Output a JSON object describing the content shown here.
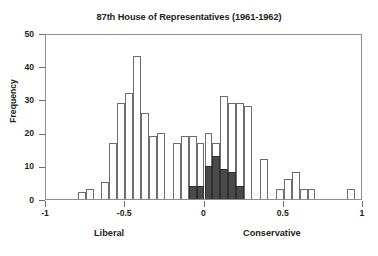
{
  "chart_data": {
    "type": "bar",
    "title": "87th House of Representatives (1961-1962)",
    "xlabel": "",
    "ylabel": "Frequency",
    "xlim": [
      -1,
      1
    ],
    "ylim": [
      0,
      50
    ],
    "grid": false,
    "legend": null,
    "x_ticks": [
      {
        "value": -1,
        "label": "-1"
      },
      {
        "value": -0.5,
        "label": "-0.5"
      },
      {
        "value": 0,
        "label": "0"
      },
      {
        "value": 0.5,
        "label": "0.5"
      },
      {
        "value": 1,
        "label": "1"
      }
    ],
    "y_ticks": [
      {
        "value": 0,
        "label": "0"
      },
      {
        "value": 10,
        "label": "10"
      },
      {
        "value": 20,
        "label": "20"
      },
      {
        "value": 30,
        "label": "30"
      },
      {
        "value": 40,
        "label": "40"
      },
      {
        "value": 50,
        "label": "50"
      }
    ],
    "annotations": [
      {
        "text": "Liberal",
        "position": "below-axis-left"
      },
      {
        "text": "Conservative",
        "position": "below-axis-right"
      }
    ],
    "bin_width": 0.05,
    "colors": {
      "light_fill": "#ffffff",
      "light_edge": "#6e6e6e",
      "dark_fill": "#4a4a4a",
      "dark_edge": "#2f2f2f",
      "axis": "#8d8d8d",
      "text": "#231f20"
    },
    "bins": [
      {
        "x0": -0.8,
        "x1": -0.75,
        "total": 2,
        "shaded": 0
      },
      {
        "x0": -0.75,
        "x1": -0.7,
        "total": 3,
        "shaded": 0
      },
      {
        "x0": -0.7,
        "x1": -0.65,
        "total": 0,
        "shaded": 0
      },
      {
        "x0": -0.65,
        "x1": -0.6,
        "total": 5,
        "shaded": 0
      },
      {
        "x0": -0.6,
        "x1": -0.55,
        "total": 17,
        "shaded": 0
      },
      {
        "x0": -0.55,
        "x1": -0.5,
        "total": 29,
        "shaded": 0
      },
      {
        "x0": -0.5,
        "x1": -0.45,
        "total": 32,
        "shaded": 0
      },
      {
        "x0": -0.45,
        "x1": -0.4,
        "total": 43,
        "shaded": 0
      },
      {
        "x0": -0.4,
        "x1": -0.35,
        "total": 26,
        "shaded": 0
      },
      {
        "x0": -0.35,
        "x1": -0.3,
        "total": 19,
        "shaded": 0
      },
      {
        "x0": -0.3,
        "x1": -0.25,
        "total": 20,
        "shaded": 0
      },
      {
        "x0": -0.25,
        "x1": -0.2,
        "total": 0,
        "shaded": 0
      },
      {
        "x0": -0.2,
        "x1": -0.15,
        "total": 17,
        "shaded": 0
      },
      {
        "x0": -0.15,
        "x1": -0.1,
        "total": 19,
        "shaded": 0
      },
      {
        "x0": -0.1,
        "x1": -0.05,
        "total": 19,
        "shaded": 4
      },
      {
        "x0": -0.05,
        "x1": 0.0,
        "total": 17,
        "shaded": 4
      },
      {
        "x0": 0.0,
        "x1": 0.05,
        "total": 20,
        "shaded": 10
      },
      {
        "x0": 0.05,
        "x1": 0.1,
        "total": 17,
        "shaded": 13
      },
      {
        "x0": 0.1,
        "x1": 0.15,
        "total": 31,
        "shaded": 9
      },
      {
        "x0": 0.15,
        "x1": 0.2,
        "total": 29,
        "shaded": 8
      },
      {
        "x0": 0.2,
        "x1": 0.25,
        "total": 29,
        "shaded": 4
      },
      {
        "x0": 0.25,
        "x1": 0.3,
        "total": 28,
        "shaded": 0
      },
      {
        "x0": 0.3,
        "x1": 0.35,
        "total": 0,
        "shaded": 0
      },
      {
        "x0": 0.35,
        "x1": 0.4,
        "total": 12,
        "shaded": 0
      },
      {
        "x0": 0.4,
        "x1": 0.45,
        "total": 0,
        "shaded": 0
      },
      {
        "x0": 0.45,
        "x1": 0.5,
        "total": 3,
        "shaded": 0
      },
      {
        "x0": 0.5,
        "x1": 0.55,
        "total": 6,
        "shaded": 0
      },
      {
        "x0": 0.55,
        "x1": 0.6,
        "total": 8,
        "shaded": 0
      },
      {
        "x0": 0.6,
        "x1": 0.65,
        "total": 3,
        "shaded": 0
      },
      {
        "x0": 0.65,
        "x1": 0.7,
        "total": 3,
        "shaded": 0
      },
      {
        "x0": 0.7,
        "x1": 0.9,
        "total": 0,
        "shaded": 0
      },
      {
        "x0": 0.9,
        "x1": 0.95,
        "total": 3,
        "shaded": 0
      }
    ]
  }
}
